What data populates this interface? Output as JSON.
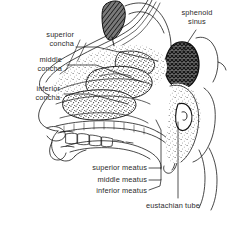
{
  "figure": {
    "background_color": "#ffffff",
    "ink_color": "#1a1a1a",
    "label_color": "#2b2b2b"
  },
  "labels": {
    "sphenoid_sinus": {
      "line1": "sphenoid",
      "line2": "sinus"
    },
    "superior_concha": {
      "line1": "superior",
      "line2": "concha"
    },
    "middle_concha": {
      "line1": "middle",
      "line2": "concha"
    },
    "inferior_concha": {
      "line1": "inferior",
      "line2": "concha"
    },
    "superior_meatus": {
      "text": "superior meatus"
    },
    "middle_meatus": {
      "text": "middle meatus"
    },
    "inferior_meatus": {
      "text": "inferior meatus"
    },
    "eustachian_tube": {
      "text": "eustachian tube"
    }
  },
  "structures": [
    {
      "name": "frontal-sinus",
      "shading": "dark-hatch"
    },
    {
      "name": "sphenoid-sinus",
      "shading": "cross-hatch"
    },
    {
      "name": "superior-concha",
      "shading": "stipple"
    },
    {
      "name": "middle-concha",
      "shading": "stipple"
    },
    {
      "name": "inferior-concha",
      "shading": "stipple"
    },
    {
      "name": "nasopharynx",
      "shading": "stipple"
    },
    {
      "name": "eustachian-tube-opening",
      "shading": "line"
    },
    {
      "name": "hard-palate",
      "shading": "outline"
    },
    {
      "name": "tongue",
      "shading": "outline"
    },
    {
      "name": "teeth",
      "shading": "outline"
    },
    {
      "name": "lips",
      "shading": "outline"
    }
  ]
}
